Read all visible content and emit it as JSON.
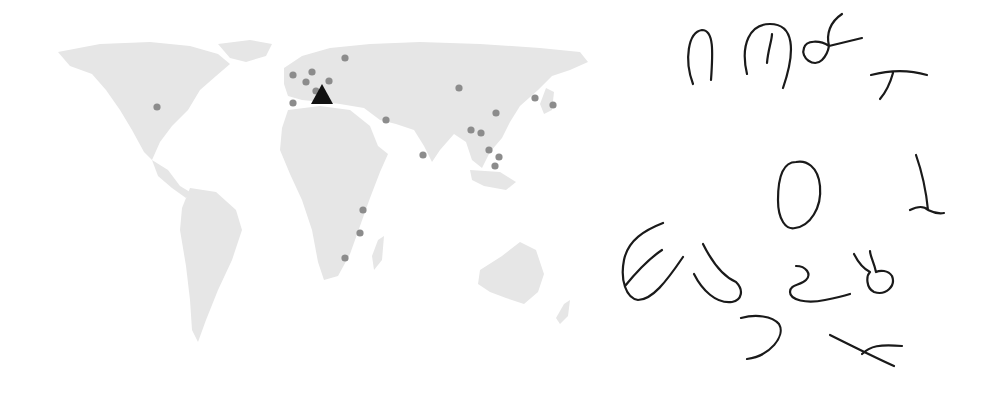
{
  "map": {
    "land_color": "#e6e6e6",
    "dot_color": "#8c8c8c",
    "marker_color": "#111111",
    "marker": {
      "shape": "triangle",
      "x": 282,
      "y": 65
    },
    "dots": [
      [
        117,
        77
      ],
      [
        253,
        45
      ],
      [
        305,
        28
      ],
      [
        266,
        52
      ],
      [
        272,
        42
      ],
      [
        276,
        61
      ],
      [
        289,
        51
      ],
      [
        253,
        73
      ],
      [
        346,
        90
      ],
      [
        419,
        58
      ],
      [
        495,
        68
      ],
      [
        513,
        75
      ],
      [
        456,
        83
      ],
      [
        431,
        100
      ],
      [
        441,
        103
      ],
      [
        449,
        120
      ],
      [
        383,
        125
      ],
      [
        459,
        127
      ],
      [
        455,
        136
      ],
      [
        323,
        180
      ],
      [
        320,
        203
      ],
      [
        305,
        228
      ]
    ]
  },
  "glyphs": {
    "stroke_color": "#1a1a1a",
    "count": 12
  }
}
